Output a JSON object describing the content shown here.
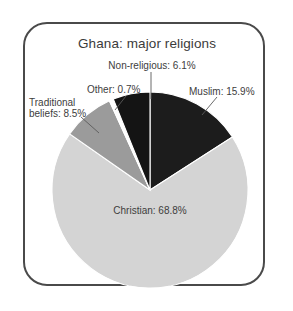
{
  "figure": {
    "title": "Ghana: major religions",
    "frame": {
      "border_color": "#4a4a4a",
      "corner_radius": "24px"
    }
  },
  "chart_data": {
    "type": "pie",
    "title": "Ghana: major religions",
    "xlabel": "",
    "ylabel": "",
    "legend_position": "none",
    "labels_inline": true,
    "start_angle_deg": 0,
    "direction": "clockwise",
    "categories": [
      "Muslim",
      "Christian",
      "Traditional beliefs",
      "Other",
      "Non-religious"
    ],
    "values": [
      15.9,
      68.8,
      8.5,
      0.7,
      6.1
    ],
    "units": "percent",
    "colors": [
      "#1c1c1c",
      "#d4d4d4",
      "#9b9b9b",
      "#fdfdfd",
      "#141414"
    ],
    "slices": [
      {
        "name": "Muslim",
        "value": 15.9,
        "label": "Muslim: 15.9%",
        "color": "#1c1c1c",
        "start_deg": 0,
        "end_deg": 57.24
      },
      {
        "name": "Christian",
        "value": 68.8,
        "label": "Christian: 68.8%",
        "color": "#d4d4d4",
        "start_deg": 57.24,
        "end_deg": 305.0
      },
      {
        "name": "Traditional beliefs",
        "value": 8.5,
        "label": "Traditional beliefs: 8.5%",
        "label_line_1": "Traditional",
        "label_line_2": "beliefs: 8.5%",
        "color": "#9b9b9b",
        "start_deg": 305.0,
        "end_deg": 335.6
      },
      {
        "name": "Other",
        "value": 0.7,
        "label": "Other: 0.7%",
        "color": "#fdfdfd",
        "start_deg": 335.6,
        "end_deg": 338.12
      },
      {
        "name": "Non-religious",
        "value": 6.1,
        "label": "Non-religious: 6.1%",
        "color": "#141414",
        "start_deg": 338.12,
        "end_deg": 360.0
      }
    ]
  },
  "labels": {
    "non_religious": "Non-religious: 6.1%",
    "muslim": "Muslim: 15.9%",
    "other": "Other: 0.7%",
    "traditional_line1": "Traditional",
    "traditional_line2": "beliefs: 8.5%",
    "christian": "Christian: 68.8%"
  }
}
